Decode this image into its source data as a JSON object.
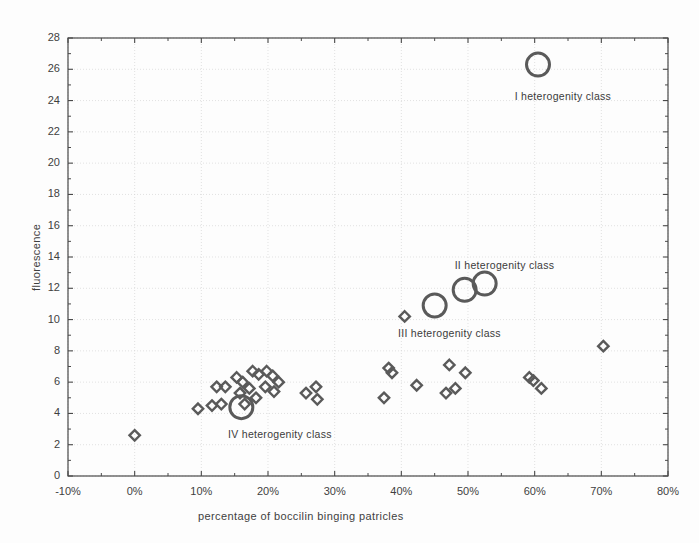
{
  "chart_data": {
    "type": "scatter",
    "title": "",
    "xlabel": "percentage of boccilin binging patricles",
    "ylabel": "fluorescence",
    "xlim": [
      -10,
      80
    ],
    "ylim": [
      0,
      28
    ],
    "xticks": [
      "-10%",
      "0%",
      "10%",
      "20%",
      "30%",
      "40%",
      "50%",
      "60%",
      "70%",
      "80%"
    ],
    "xtick_values": [
      -10,
      0,
      10,
      20,
      30,
      40,
      50,
      60,
      70,
      80
    ],
    "yticks": [
      "0",
      "2",
      "4",
      "6",
      "8",
      "10",
      "12",
      "14",
      "16",
      "18",
      "20",
      "22",
      "24",
      "26",
      "28"
    ],
    "ytick_values": [
      0,
      2,
      4,
      6,
      8,
      10,
      12,
      14,
      16,
      18,
      20,
      22,
      24,
      26,
      28
    ],
    "grid": true,
    "legend": "none",
    "marker_color": "#5a5a5a",
    "marker_shape_small": "diamond",
    "marker_shape_large": "circle",
    "points": [
      {
        "x": 0.0,
        "y": 2.6,
        "size": "small"
      },
      {
        "x": 9.5,
        "y": 4.3,
        "size": "small"
      },
      {
        "x": 12.3,
        "y": 5.7,
        "size": "small"
      },
      {
        "x": 13.6,
        "y": 5.7,
        "size": "small"
      },
      {
        "x": 11.6,
        "y": 4.5,
        "size": "small"
      },
      {
        "x": 13.0,
        "y": 4.6,
        "size": "small"
      },
      {
        "x": 15.3,
        "y": 6.3,
        "size": "small"
      },
      {
        "x": 16.2,
        "y": 6.0,
        "size": "small"
      },
      {
        "x": 15.8,
        "y": 5.3,
        "size": "small"
      },
      {
        "x": 17.7,
        "y": 6.7,
        "size": "small"
      },
      {
        "x": 18.6,
        "y": 6.5,
        "size": "small"
      },
      {
        "x": 17.2,
        "y": 5.6,
        "size": "small"
      },
      {
        "x": 18.2,
        "y": 5.0,
        "size": "small"
      },
      {
        "x": 16.5,
        "y": 4.6,
        "size": "small"
      },
      {
        "x": 19.8,
        "y": 6.7,
        "size": "small"
      },
      {
        "x": 20.7,
        "y": 6.4,
        "size": "small"
      },
      {
        "x": 19.6,
        "y": 5.7,
        "size": "small"
      },
      {
        "x": 20.9,
        "y": 5.4,
        "size": "small"
      },
      {
        "x": 21.6,
        "y": 6.0,
        "size": "small"
      },
      {
        "x": 16.0,
        "y": 4.4,
        "size": "large"
      },
      {
        "x": 25.7,
        "y": 5.3,
        "size": "small"
      },
      {
        "x": 27.2,
        "y": 5.7,
        "size": "small"
      },
      {
        "x": 27.4,
        "y": 4.9,
        "size": "small"
      },
      {
        "x": 37.4,
        "y": 5.0,
        "size": "small"
      },
      {
        "x": 38.1,
        "y": 6.9,
        "size": "small"
      },
      {
        "x": 38.6,
        "y": 6.6,
        "size": "small"
      },
      {
        "x": 40.5,
        "y": 10.2,
        "size": "small"
      },
      {
        "x": 42.3,
        "y": 5.8,
        "size": "small"
      },
      {
        "x": 46.7,
        "y": 5.3,
        "size": "small"
      },
      {
        "x": 47.2,
        "y": 7.1,
        "size": "small"
      },
      {
        "x": 48.1,
        "y": 5.6,
        "size": "small"
      },
      {
        "x": 49.6,
        "y": 6.6,
        "size": "small"
      },
      {
        "x": 45.0,
        "y": 10.9,
        "size": "large"
      },
      {
        "x": 49.5,
        "y": 11.9,
        "size": "large"
      },
      {
        "x": 52.5,
        "y": 12.3,
        "size": "large"
      },
      {
        "x": 59.2,
        "y": 6.3,
        "size": "small"
      },
      {
        "x": 59.8,
        "y": 6.1,
        "size": "small"
      },
      {
        "x": 61.0,
        "y": 5.6,
        "size": "small"
      },
      {
        "x": 60.5,
        "y": 26.3,
        "size": "large"
      },
      {
        "x": 70.3,
        "y": 8.3,
        "size": "small"
      }
    ],
    "annotations": [
      {
        "text": "I heterogenity class",
        "x": 57.0,
        "y": 24.2,
        "name": "class-i"
      },
      {
        "text": "II heterogenity class",
        "x": 48.0,
        "y": 13.4,
        "name": "class-ii"
      },
      {
        "text": "III heterogenity class",
        "x": 39.5,
        "y": 9.1,
        "name": "class-iii"
      },
      {
        "text": "IV heterogenity class",
        "x": 14.0,
        "y": 2.6,
        "name": "class-iv"
      }
    ]
  }
}
